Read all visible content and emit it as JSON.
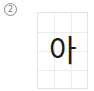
{
  "item": {
    "number_label": "2",
    "character": "아"
  },
  "grid": {
    "columns": 3,
    "rows": 4,
    "line_color": "#ececec"
  }
}
